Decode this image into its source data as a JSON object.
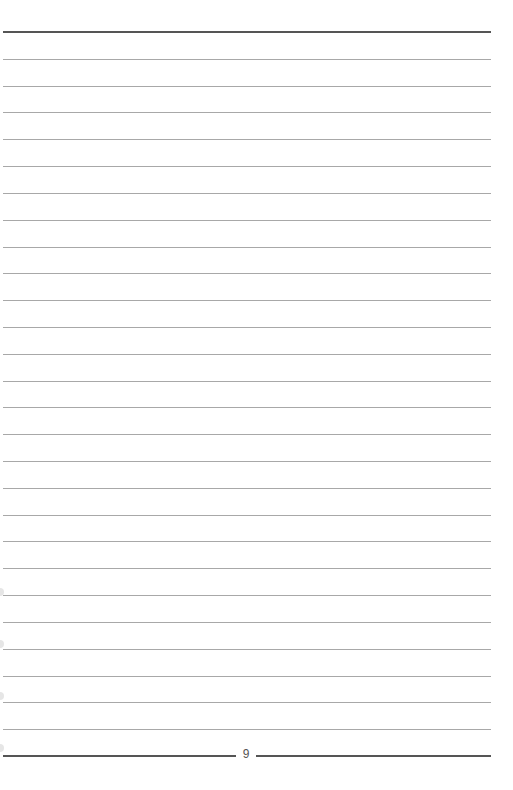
{
  "page": {
    "page_number": "9",
    "top_rule_y": 32,
    "bottom_rule_y": 756,
    "ruled_line_count": 26,
    "line_spacing_px": 26.8,
    "colors": {
      "thin_rule": "#a8a8a8",
      "thick_rule": "#555555",
      "background": "#ffffff"
    }
  }
}
